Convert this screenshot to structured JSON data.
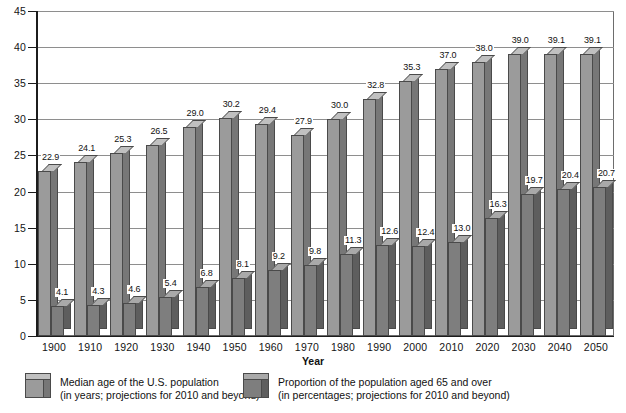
{
  "chart_data": {
    "type": "bar",
    "title": "",
    "subtitle": "",
    "xlabel": "Year",
    "ylabel": "",
    "ylim": [
      0,
      45
    ],
    "ytick_step": 5,
    "grid": true,
    "legend_position": "bottom",
    "categories": [
      "1900",
      "1910",
      "1920",
      "1930",
      "1940",
      "1950",
      "1960",
      "1970",
      "1980",
      "1990",
      "2000",
      "2010",
      "2020",
      "2030",
      "2040",
      "2050"
    ],
    "yticks": [
      "0",
      "5",
      "10",
      "15",
      "20",
      "25",
      "30",
      "35",
      "40",
      "45"
    ],
    "series": [
      {
        "name": "Median age of the U.S. population",
        "note": "(in years; projections for 2010 and beyond)",
        "color": "#9b9b9b",
        "values": [
          22.9,
          24.1,
          25.3,
          26.5,
          29.0,
          30.2,
          29.4,
          27.9,
          30.0,
          32.8,
          35.3,
          37.0,
          38.0,
          39.0,
          39.1,
          39.1
        ],
        "labels": [
          "22.9",
          "24.1",
          "25.3",
          "26.5",
          "29.0",
          "30.2",
          "29.4",
          "27.9",
          "30.0",
          "32.8",
          "35.3",
          "37.0",
          "38.0",
          "39.0",
          "39.1",
          "39.1"
        ]
      },
      {
        "name": "Proportion of the population aged 65 and over",
        "note": "(in percentages; projections for 2010 and beyond)",
        "color": "#7e7e7e",
        "values": [
          4.1,
          4.3,
          4.6,
          5.4,
          6.8,
          8.1,
          9.2,
          9.8,
          11.3,
          12.6,
          12.4,
          13.0,
          16.3,
          19.7,
          20.4,
          20.7
        ],
        "labels": [
          "4.1",
          "4.3",
          "4.6",
          "5.4",
          "6.8",
          "8.1",
          "9.2",
          "9.8",
          "11.3",
          "12.6",
          "12.4",
          "13.0",
          "16.3",
          "19.7",
          "20.4",
          "20.7"
        ]
      }
    ]
  },
  "axis": {
    "x_title": "Year"
  },
  "legend": {
    "entries": [
      {
        "line1": "Median age of the U.S. population",
        "line2": "(in years; projections for 2010 and beyond)"
      },
      {
        "line1": "Proportion of the population aged 65 and over",
        "line2": "(in percentages; projections for 2010 and beyond)"
      }
    ]
  }
}
